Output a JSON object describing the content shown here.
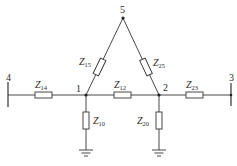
{
  "diagram": {
    "type": "electrical network / impedance diagram",
    "nodes": [
      {
        "id": "1",
        "label": "1",
        "x": 86,
        "y": 95
      },
      {
        "id": "2",
        "label": "2",
        "x": 159,
        "y": 95
      },
      {
        "id": "3",
        "label": "3",
        "x": 231,
        "y": 95
      },
      {
        "id": "4",
        "label": "4",
        "x": 8,
        "y": 95
      },
      {
        "id": "5",
        "label": "5",
        "x": 123,
        "y": 18
      }
    ],
    "impedances": [
      {
        "id": "Z14",
        "main": "Z",
        "sub": "14",
        "from": "4",
        "to": "1"
      },
      {
        "id": "Z12",
        "main": "Z",
        "sub": "12",
        "from": "1",
        "to": "2"
      },
      {
        "id": "Z23",
        "main": "Z",
        "sub": "23",
        "from": "2",
        "to": "3"
      },
      {
        "id": "Z15",
        "main": "Z",
        "sub": "15",
        "from": "1",
        "to": "5"
      },
      {
        "id": "Z25",
        "main": "Z",
        "sub": "25",
        "from": "2",
        "to": "5"
      },
      {
        "id": "Z10",
        "main": "Z",
        "sub": "10",
        "from": "1",
        "to": "ground"
      },
      {
        "id": "Z20",
        "main": "Z",
        "sub": "20",
        "from": "2",
        "to": "ground"
      }
    ],
    "grounds": [
      "node-1",
      "node-2"
    ]
  }
}
